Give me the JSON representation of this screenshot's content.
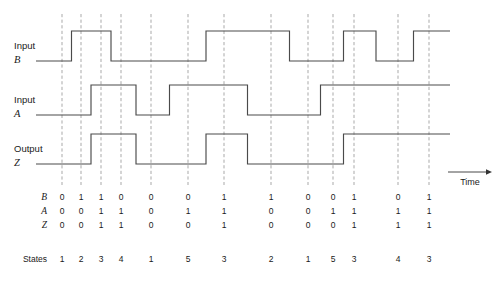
{
  "figure": {
    "time_axis_label": "Time",
    "states_row_label": "States",
    "colors": {
      "signal": "#4a4a4a",
      "gridline": "#9a9a9a",
      "text": "#1a1a1a",
      "background": "#ffffff"
    }
  },
  "signals": [
    {
      "id": "B",
      "kind": "Input",
      "kind_label": "Input",
      "name_label": "B",
      "values": [
        0,
        1,
        1,
        0,
        0,
        0,
        1,
        1,
        0,
        0,
        1,
        0,
        1
      ]
    },
    {
      "id": "A",
      "kind": "Input",
      "kind_label": "Input",
      "name_label": "A",
      "values": [
        0,
        0,
        1,
        1,
        0,
        1,
        1,
        0,
        0,
        1,
        1,
        1,
        1
      ]
    },
    {
      "id": "Z",
      "kind": "Output",
      "kind_label": "Output",
      "name_label": "Z",
      "values": [
        0,
        0,
        1,
        1,
        0,
        0,
        1,
        0,
        0,
        0,
        1,
        1,
        1
      ]
    }
  ],
  "table": {
    "row_labels": [
      "B",
      "A",
      "Z"
    ],
    "rows": [
      [
        0,
        1,
        1,
        0,
        0,
        0,
        1,
        1,
        0,
        0,
        1,
        0,
        1
      ],
      [
        0,
        0,
        1,
        1,
        0,
        1,
        1,
        0,
        0,
        1,
        1,
        1,
        1
      ],
      [
        0,
        0,
        1,
        1,
        0,
        0,
        1,
        0,
        0,
        0,
        1,
        1,
        1
      ]
    ],
    "states_label": "States",
    "states": [
      1,
      2,
      3,
      4,
      1,
      5,
      3,
      2,
      1,
      5,
      3,
      4,
      3
    ]
  },
  "geometry": {
    "column_x": [
      62,
      81,
      101,
      121,
      151,
      188,
      224,
      271,
      308,
      333,
      354,
      398,
      429
    ],
    "wave_start_x": 36,
    "wave_end_x": 450,
    "gridline_top": 14,
    "gridline_bottom": 185,
    "signal_rows": [
      {
        "id": "B",
        "high_y": 31,
        "low_y": 61
      },
      {
        "id": "A",
        "high_y": 85,
        "low_y": 115
      },
      {
        "id": "Z",
        "high_y": 134,
        "low_y": 164
      }
    ],
    "table_rows_y": [
      200,
      214,
      228
    ],
    "states_y": 262,
    "row_label_x": 47,
    "time_arrow": {
      "x1": 448,
      "x2": 492,
      "y": 172,
      "label_x": 470,
      "label_y": 185
    }
  }
}
